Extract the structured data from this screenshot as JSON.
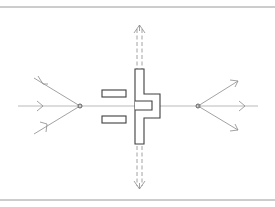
{
  "figure": {
    "kind": "patent-style line drawing",
    "colors": {
      "background": "#ffffff",
      "frame_lines": "#9a9a9a",
      "rays": "#8a8a8a",
      "solid_parts": "#3e3e3e"
    },
    "elements": {
      "top_border": "horizontal frame line",
      "bottom_border": "horizontal frame line",
      "optical_axis": "horizontal centre line",
      "left_focus_point": "converging point with three incoming rays",
      "slit_plates": "two small rectangular plates",
      "t_element": "T-shaped component with rightward flange",
      "vertical_beam": "dashed double line with arrows up and down",
      "right_source_point": "diverging point with three outgoing rays"
    }
  }
}
